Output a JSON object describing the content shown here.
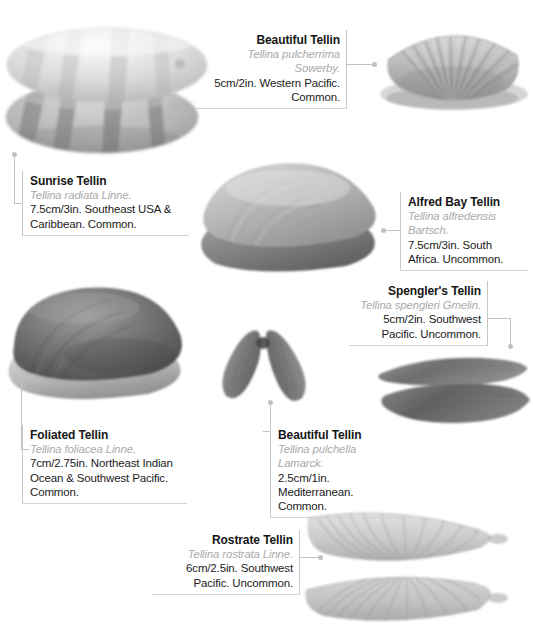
{
  "page": {
    "width": 533,
    "height": 630,
    "background": "#ffffff",
    "kind": "shell-identification-plate"
  },
  "style": {
    "title_color": "#161616",
    "species_color": "#a9a9a9",
    "body_color": "#1c1c1c",
    "rule_color": "#c8c8c8",
    "leader_color": "#c2c2c2",
    "dot_color": "#c0c0c0"
  },
  "captions": [
    {
      "id": "sunrise-tellin",
      "title": "Sunrise Tellin",
      "species": "Tellina radiata Linne.",
      "description": "7.5cm/3in. Southeast USA & Caribbean. Common.",
      "size": "7.5cm/3in.",
      "range": "Southeast USA & Caribbean.",
      "frequency": "Common.",
      "align": "left"
    },
    {
      "id": "beautiful-tellin-pulcherrima",
      "title": "Beautiful Tellin",
      "species": "Tellina pulcherrima Sowerby.",
      "description": "5cm/2in. Western Pacific. Common.",
      "size": "5cm/2in.",
      "range": "Western Pacific.",
      "frequency": "Common.",
      "align": "right"
    },
    {
      "id": "alfred-bay-tellin",
      "title": "Alfred Bay Tellin",
      "species": "Tellina alfredensis Bartsch.",
      "description": "7.5cm/3in. South Africa. Uncommon.",
      "size": "7.5cm/3in.",
      "range": "South Africa.",
      "frequency": "Uncommon.",
      "align": "left"
    },
    {
      "id": "spenglers-tellin",
      "title": "Spengler's Tellin",
      "species": "Tellina spengleri Gmelin.",
      "description": "5cm/2in. Southwest Pacific. Uncommon.",
      "size": "5cm/2in.",
      "range": "Southwest Pacific.",
      "frequency": "Uncommon.",
      "align": "right"
    },
    {
      "id": "foliated-tellin",
      "title": "Foliated Tellin",
      "species": "Tellina foliacea Linne.",
      "description": "7cm/2.75in. Northeast Indian Ocean & Southwest Pacific. Common.",
      "size": "7cm/2.75in.",
      "range": "Northeast Indian Ocean & Southwest Pacific.",
      "frequency": "Common.",
      "align": "left"
    },
    {
      "id": "beautiful-tellin-pulchella",
      "title": "Beautiful Tellin",
      "species": "Tellina pulchella Lamarck.",
      "description": "2.5cm/1in. Mediterranean. Common.",
      "size": "2.5cm/1in.",
      "range": "Mediterranean.",
      "frequency": "Common.",
      "align": "left"
    },
    {
      "id": "rostrate-tellin",
      "title": "Rostrate Tellin",
      "species": "Tellina rostrata Linne.",
      "description": "6cm/2.5in. Southwest Pacific. Uncommon.",
      "size": "6cm/2.5in.",
      "range": "Southwest Pacific.",
      "frequency": "Uncommon.",
      "align": "right"
    }
  ],
  "specimens": [
    {
      "id": "sunrise-tellin-photo",
      "label": "pair of banded oval shells, upper pale with dark rays, lower darker"
    },
    {
      "id": "beautiful-tellin-pulcherrima-photo",
      "label": "ribbed fan-shaped shell with radial ridges"
    },
    {
      "id": "alfred-bay-tellin-photo",
      "label": "two overlapping broad oval shells"
    },
    {
      "id": "foliated-tellin-photo",
      "label": "large dark rounded shell over pale valve"
    },
    {
      "id": "beautiful-tellin-pulchella-photo",
      "label": "two small elongated valves joined in a V"
    },
    {
      "id": "spenglers-tellin-photo",
      "label": "two elongated beaked shells stacked"
    },
    {
      "id": "rostrate-tellin-photo",
      "label": "two beaked shells with concentric ridges facing each other"
    }
  ]
}
